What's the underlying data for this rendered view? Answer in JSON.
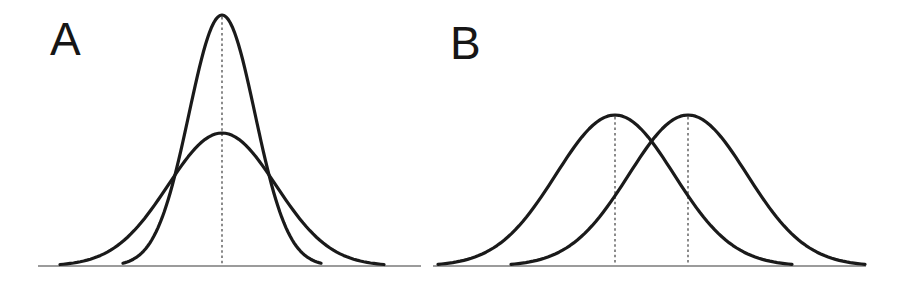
{
  "figure": {
    "colors": {
      "background": "#ffffff",
      "curve": "#1a1a1a",
      "baseline": "#7a7a7a",
      "mean_dash": "#4d4d4d",
      "label": "#161616"
    }
  },
  "chart_data": [
    {
      "type": "line",
      "panel_label": "A",
      "curve_style": "normal-distribution",
      "axes": "none",
      "grid": false,
      "legend": "none",
      "tick_labels": "none",
      "curves": [
        {
          "name": "narrow-tall-curve",
          "mean_px": 222,
          "sigma_px": 33,
          "peak_y_px": 15
        },
        {
          "name": "wide-short-curve",
          "mean_px": 222,
          "sigma_px": 54,
          "peak_y_px": 133
        }
      ],
      "mean_markers_px": [
        222
      ],
      "baseline_px": {
        "x1": 38,
        "x2": 421,
        "y": 266
      }
    },
    {
      "type": "line",
      "panel_label": "B",
      "curve_style": "normal-distribution",
      "axes": "none",
      "grid": false,
      "legend": "none",
      "tick_labels": "none",
      "curves": [
        {
          "name": "left-curve",
          "mean_px": 615,
          "sigma_px": 59,
          "peak_y_px": 115
        },
        {
          "name": "right-curve",
          "mean_px": 688,
          "sigma_px": 59,
          "peak_y_px": 115
        }
      ],
      "mean_markers_px": [
        615,
        688
      ],
      "baseline_px": {
        "x1": 433,
        "x2": 866,
        "y": 266
      }
    }
  ]
}
